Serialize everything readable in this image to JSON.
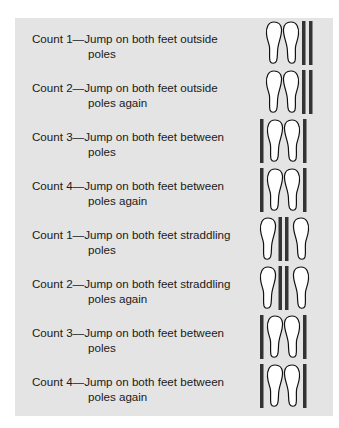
{
  "colors": {
    "panel_bg": "#e4e4e4",
    "pole": "#333333",
    "foot_fill": "#ffffff",
    "foot_stroke": "#111111",
    "text": "#1a1a1a"
  },
  "rows": [
    {
      "count": "Count 1—",
      "line1": "Jump on both feet outside",
      "line2": "poles",
      "figure": "feet-outside-poles-icon"
    },
    {
      "count": "Count 2—",
      "line1": "Jump on both feet outside",
      "line2": "poles again",
      "figure": "feet-outside-poles-icon"
    },
    {
      "count": "Count 3—",
      "line1": "Jump on both feet between",
      "line2": "poles",
      "figure": "feet-between-poles-icon"
    },
    {
      "count": "Count 4—",
      "line1": "Jump on both feet between",
      "line2": "poles again",
      "figure": "feet-between-poles-icon"
    },
    {
      "count": "Count 1—",
      "line1": "Jump on both feet straddling",
      "line2": "poles",
      "figure": "feet-straddling-poles-icon"
    },
    {
      "count": "Count 2—",
      "line1": "Jump on both feet straddling",
      "line2": "poles again",
      "figure": "feet-straddling-poles-icon"
    },
    {
      "count": "Count 3—",
      "line1": "Jump on both feet between",
      "line2": "poles",
      "figure": "feet-between-poles-icon"
    },
    {
      "count": "Count 4—",
      "line1": "Jump on both feet between",
      "line2": "poles again",
      "figure": "feet-between-poles-icon"
    }
  ]
}
